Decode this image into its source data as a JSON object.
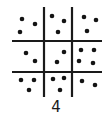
{
  "figure": {
    "kind": "dot-array-grid",
    "title": "",
    "background_color": "#ffffff",
    "ink_color": "#1a1a1a",
    "dot_color": "#141414",
    "canvas": {
      "width": 110,
      "height": 117
    },
    "grid": {
      "rows": 3,
      "columns": 3,
      "line_color": "#1a1a1a",
      "line_width": 2.2,
      "vertical_lines": [
        {
          "name": "vertical-line-left",
          "x": 44,
          "y1": 7,
          "y2": 97
        },
        {
          "name": "vertical-line-right",
          "x": 72,
          "y1": 7,
          "y2": 97
        }
      ],
      "horizontal_lines": [
        {
          "name": "horizontal-line-top",
          "y": 41,
          "x1": 12,
          "x2": 102
        },
        {
          "name": "horizontal-line-bottom",
          "y": 72,
          "x1": 12,
          "x2": 102
        }
      ]
    },
    "cells": [
      {
        "name": "cell-top-left",
        "row": 0,
        "col": 0,
        "dot_count": 3,
        "dots": [
          {
            "cx": 22,
            "cy": 19
          },
          {
            "cx": 35,
            "cy": 24
          },
          {
            "cx": 20,
            "cy": 32
          }
        ]
      },
      {
        "name": "cell-top-center",
        "row": 0,
        "col": 1,
        "dot_count": 3,
        "dots": [
          {
            "cx": 52,
            "cy": 16
          },
          {
            "cx": 64,
            "cy": 21
          },
          {
            "cx": 58,
            "cy": 32
          }
        ]
      },
      {
        "name": "cell-top-right",
        "row": 0,
        "col": 2,
        "dot_count": 3,
        "dots": [
          {
            "cx": 84,
            "cy": 17
          },
          {
            "cx": 96,
            "cy": 20
          },
          {
            "cx": 87,
            "cy": 31
          }
        ]
      },
      {
        "name": "cell-middle-left",
        "row": 1,
        "col": 0,
        "dot_count": 2,
        "dots": [
          {
            "cx": 26,
            "cy": 53
          },
          {
            "cx": 35,
            "cy": 61
          }
        ]
      },
      {
        "name": "cell-middle-center",
        "row": 1,
        "col": 1,
        "dot_count": 2,
        "dots": [
          {
            "cx": 64,
            "cy": 52
          },
          {
            "cx": 57,
            "cy": 62
          }
        ]
      },
      {
        "name": "cell-middle-right",
        "row": 1,
        "col": 2,
        "dot_count": 4,
        "dots": [
          {
            "cx": 81,
            "cy": 50
          },
          {
            "cx": 94,
            "cy": 50
          },
          {
            "cx": 79,
            "cy": 61
          },
          {
            "cx": 93,
            "cy": 63
          }
        ]
      },
      {
        "name": "cell-bottom-left",
        "row": 2,
        "col": 0,
        "dot_count": 3,
        "dots": [
          {
            "cx": 21,
            "cy": 80
          },
          {
            "cx": 34,
            "cy": 80
          },
          {
            "cx": 29,
            "cy": 90
          }
        ]
      },
      {
        "name": "cell-bottom-center",
        "row": 2,
        "col": 1,
        "dot_count": 3,
        "dots": [
          {
            "cx": 53,
            "cy": 79
          },
          {
            "cx": 64,
            "cy": 78
          },
          {
            "cx": 60,
            "cy": 90
          }
        ]
      },
      {
        "name": "cell-bottom-right",
        "row": 2,
        "col": 2,
        "dot_count": 2,
        "dots": [
          {
            "cx": 82,
            "cy": 81
          },
          {
            "cx": 95,
            "cy": 85
          }
        ]
      }
    ],
    "dot_radius": 2.3,
    "total_dots": 25,
    "caption": {
      "text": "4",
      "x": 56,
      "y": 112
    }
  }
}
